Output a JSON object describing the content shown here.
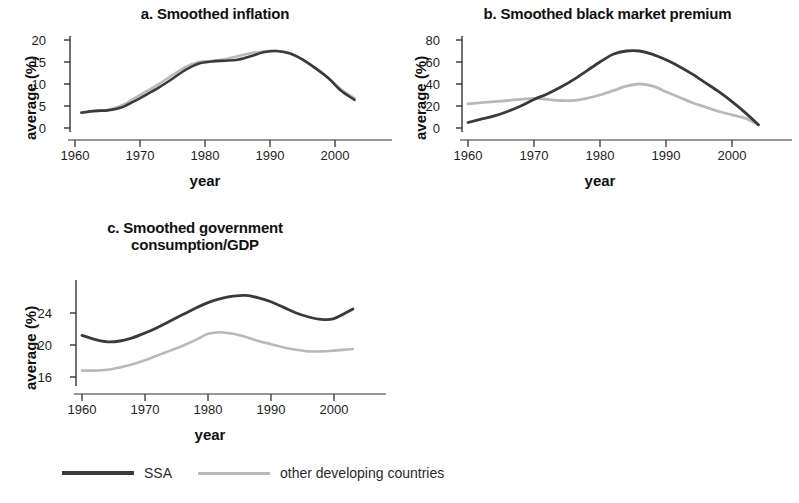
{
  "figure": {
    "background": "#ffffff",
    "series_colors": {
      "ssa": "#3a3a3a",
      "other": "#b9b9b9"
    }
  },
  "legend": {
    "position": "bottom",
    "entries": [
      {
        "label": "SSA",
        "color": "#3a3a3a",
        "style": "thick"
      },
      {
        "label": "other developing countries",
        "color": "#b9b9b9",
        "style": "thin"
      }
    ]
  },
  "panels": {
    "a": {
      "title": "a. Smoothed inflation",
      "ylabel": "average (%)",
      "xlabel": "year",
      "yticks": [
        "0",
        "5",
        "10",
        "15",
        "20"
      ],
      "xticks": [
        "1960",
        "1970",
        "1980",
        "1990",
        "2000"
      ]
    },
    "b": {
      "title": "b. Smoothed black market premium",
      "ylabel": "average (%)",
      "xlabel": "year",
      "yticks": [
        "0",
        "20",
        "40",
        "60",
        "80"
      ],
      "xticks": [
        "1960",
        "1970",
        "1980",
        "1990",
        "2000"
      ]
    },
    "c": {
      "title_line1": "c. Smoothed government",
      "title_line2": "consumption/GDP",
      "ylabel": "average (%)",
      "xlabel": "year",
      "yticks": [
        "16",
        "20",
        "24"
      ],
      "xticks": [
        "1960",
        "1970",
        "1980",
        "1990",
        "2000"
      ]
    }
  },
  "chart_data": [
    {
      "id": "a",
      "type": "line",
      "title": "a. Smoothed inflation",
      "xlabel": "year",
      "ylabel": "average (%)",
      "xlim": [
        1960,
        2004
      ],
      "ylim": [
        0,
        21
      ],
      "yticks": [
        0,
        5,
        10,
        15,
        20
      ],
      "xticks": [
        1960,
        1970,
        1980,
        1990,
        2000
      ],
      "grid": false,
      "x": [
        1961,
        1963,
        1965,
        1967,
        1969,
        1971,
        1973,
        1975,
        1977,
        1979,
        1981,
        1983,
        1985,
        1987,
        1989,
        1991,
        1993,
        1995,
        1997,
        1999,
        2001,
        2003
      ],
      "series": [
        {
          "name": "SSA",
          "color": "#3a3a3a",
          "values": [
            3.5,
            3.9,
            4.0,
            4.6,
            6.0,
            7.6,
            9.3,
            11.2,
            13.2,
            14.6,
            15.1,
            15.3,
            15.5,
            16.3,
            17.2,
            17.5,
            17.0,
            15.6,
            13.6,
            11.3,
            8.4,
            6.4
          ]
        },
        {
          "name": "other developing countries",
          "color": "#b9b9b9",
          "values": [
            3.4,
            3.8,
            4.1,
            5.0,
            6.6,
            8.3,
            10.1,
            12.0,
            13.9,
            15.0,
            15.2,
            15.6,
            16.3,
            17.0,
            17.4,
            17.5,
            16.9,
            15.5,
            13.5,
            11.3,
            8.7,
            6.8
          ]
        }
      ]
    },
    {
      "id": "b",
      "type": "line",
      "title": "b. Smoothed black market premium",
      "xlabel": "year",
      "ylabel": "average (%)",
      "xlim": [
        1960,
        2004
      ],
      "ylim": [
        0,
        84
      ],
      "yticks": [
        0,
        20,
        40,
        60,
        80
      ],
      "xticks": [
        1960,
        1970,
        1980,
        1990,
        2000
      ],
      "grid": false,
      "x": [
        1960,
        1962,
        1964,
        1966,
        1968,
        1970,
        1972,
        1974,
        1976,
        1978,
        1980,
        1982,
        1984,
        1986,
        1988,
        1990,
        1992,
        1994,
        1996,
        1998,
        2000,
        2002,
        2004
      ],
      "series": [
        {
          "name": "SSA",
          "color": "#3a3a3a",
          "values": [
            5,
            8,
            11,
            15,
            20,
            26,
            31,
            37,
            44,
            52,
            60,
            67,
            70,
            70,
            67,
            62,
            56,
            49,
            41,
            33,
            24,
            14,
            3
          ]
        },
        {
          "name": "other developing countries",
          "color": "#b9b9b9",
          "values": [
            22,
            23,
            24,
            25,
            26,
            27,
            26,
            25,
            25,
            27,
            30,
            34,
            38,
            40,
            38,
            33,
            28,
            23,
            19,
            15,
            12,
            9,
            3
          ]
        }
      ]
    },
    {
      "id": "c",
      "type": "line",
      "title": "c. Smoothed government consumption/GDP",
      "xlabel": "year",
      "ylabel": "average (%)",
      "xlim": [
        1960,
        2003
      ],
      "ylim": [
        14.6,
        27.2
      ],
      "yticks": [
        16,
        20,
        24
      ],
      "xticks": [
        1960,
        1970,
        1980,
        1990,
        2000
      ],
      "grid": false,
      "x": [
        1960,
        1962,
        1964,
        1966,
        1968,
        1970,
        1972,
        1974,
        1976,
        1978,
        1980,
        1982,
        1984,
        1986,
        1988,
        1990,
        1992,
        1994,
        1996,
        1998,
        2000,
        2003
      ],
      "series": [
        {
          "name": "SSA",
          "color": "#3a3a3a",
          "values": [
            21.2,
            20.7,
            20.4,
            20.5,
            20.9,
            21.5,
            22.2,
            23.0,
            23.8,
            24.6,
            25.3,
            25.8,
            26.1,
            26.2,
            25.9,
            25.4,
            24.7,
            24.0,
            23.5,
            23.2,
            23.3,
            24.5
          ]
        },
        {
          "name": "other developing countries",
          "color": "#b9b9b9",
          "values": [
            16.8,
            16.8,
            16.9,
            17.2,
            17.6,
            18.1,
            18.7,
            19.3,
            19.9,
            20.6,
            21.4,
            21.6,
            21.4,
            21.0,
            20.5,
            20.1,
            19.7,
            19.4,
            19.2,
            19.2,
            19.3,
            19.5
          ]
        }
      ]
    }
  ]
}
